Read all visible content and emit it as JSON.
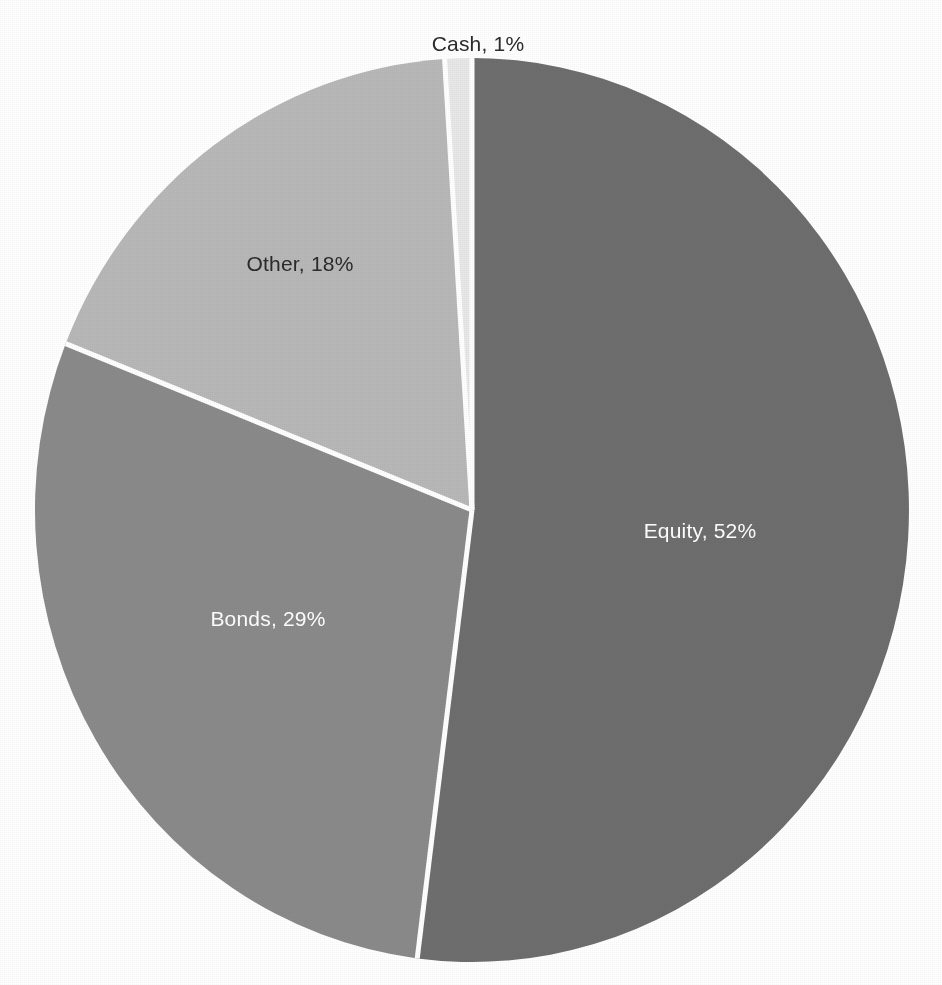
{
  "chart_data": {
    "type": "pie",
    "title": "",
    "subtitle": "",
    "xlabel": "",
    "ylabel": "",
    "legend_position": "none",
    "grid": false,
    "label_format": "{name}, {value}%",
    "categories": [
      "Equity",
      "Bonds",
      "Other",
      "Cash"
    ],
    "values": [
      52,
      29,
      18,
      1
    ],
    "colors": [
      "#6e6e6e",
      "#8a8a8a",
      "#b8b8b8",
      "#e8e8e8"
    ],
    "slices": [
      {
        "name": "Equity",
        "value": 52,
        "label": "Equity, 52%",
        "color": "#6e6e6e",
        "label_color": "#ffffff",
        "label_placement": "inside",
        "label_x": 700,
        "label_y": 532,
        "start_angle_deg": 0,
        "end_angle_deg": 187.2
      },
      {
        "name": "Bonds",
        "value": 29,
        "label": "Bonds, 29%",
        "color": "#8a8a8a",
        "label_color": "#ffffff",
        "label_placement": "inside",
        "label_x": 268,
        "label_y": 620,
        "start_angle_deg": 187.2,
        "end_angle_deg": 291.6
      },
      {
        "name": "Other",
        "value": 18,
        "label": "Other, 18%",
        "color": "#b8b8b8",
        "label_color": "#2b2b2b",
        "label_placement": "inside",
        "label_x": 300,
        "label_y": 265,
        "start_angle_deg": 291.6,
        "end_angle_deg": 356.4
      },
      {
        "name": "Cash",
        "value": 1,
        "label": "Cash, 1%",
        "color": "#e8e8e8",
        "label_color": "#2b2b2b",
        "label_placement": "outside-top",
        "label_x": 478,
        "label_y": 45,
        "start_angle_deg": 356.4,
        "end_angle_deg": 360
      }
    ],
    "geometry": {
      "center_x": 472,
      "center_y": 510,
      "radius_x": 437,
      "radius_y": 452,
      "start_at_12_oclock": true,
      "direction": "clockwise",
      "separator_color": "#ffffff",
      "separator_width": 5
    },
    "background_color": "#ffffff"
  }
}
